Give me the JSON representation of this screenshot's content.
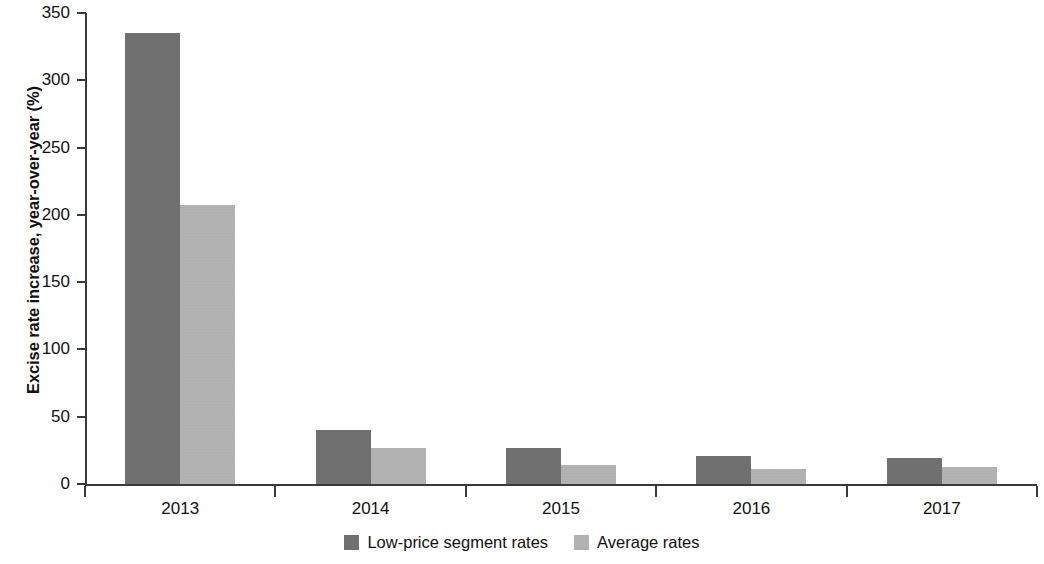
{
  "chart_data": {
    "type": "bar",
    "title": "",
    "subtitle": "",
    "xlabel": "",
    "ylabel": "Excise rate increase, year-over-year (%)",
    "categories": [
      "2013",
      "2014",
      "2015",
      "2016",
      "2017"
    ],
    "series": [
      {
        "name": "Low-price segment rates",
        "color": "#6e6e6e",
        "values": [
          335,
          40,
          27,
          21,
          19
        ]
      },
      {
        "name": "Average rates",
        "color": "#b6b6b6",
        "values": [
          207,
          27,
          14,
          11,
          13
        ]
      }
    ],
    "ylim": [
      0,
      350
    ],
    "yticks": [
      0,
      50,
      100,
      150,
      200,
      250,
      300,
      350
    ],
    "ytick_labels": [
      "0",
      "50",
      "100",
      "150",
      "200",
      "250",
      "300",
      "350"
    ],
    "grid": false,
    "legend_position": "bottom",
    "axis_color": "#3a3a3a",
    "background_color": "#ffffff"
  },
  "legend": {
    "entries": [
      {
        "label": "Low-price segment rates",
        "color": "#6e6e6e"
      },
      {
        "label": "Average rates",
        "color": "#b6b6b6"
      }
    ]
  }
}
